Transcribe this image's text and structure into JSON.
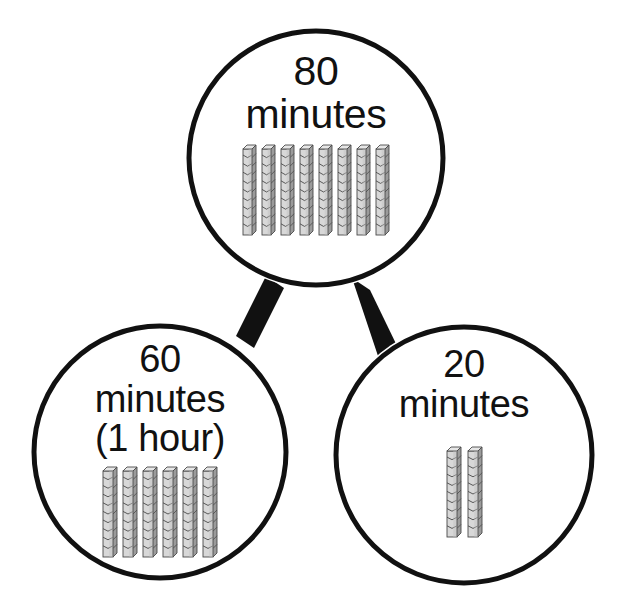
{
  "diagram": {
    "type": "number-bond",
    "background_color": "#ffffff",
    "outline_color": "#111111",
    "connector_color": "#111111"
  },
  "nodes": [
    {
      "id": "whole",
      "role": "whole",
      "label": "80\nminutes",
      "value": 80,
      "unit": "minutes",
      "rod_count": 8,
      "cubes_per_rod": 10,
      "center_x": 316,
      "center_y": 158,
      "radius": 131
    },
    {
      "id": "part-left",
      "role": "part",
      "label": "60\nminutes\n(1 hour)",
      "value": 60,
      "unit": "minutes",
      "equivalent": "1 hour",
      "rod_count": 6,
      "cubes_per_rod": 10,
      "center_x": 160,
      "center_y": 452,
      "radius": 130
    },
    {
      "id": "part-right",
      "role": "part",
      "label": "20\nminutes",
      "value": 20,
      "unit": "minutes",
      "rod_count": 2,
      "cubes_per_rod": 10,
      "center_x": 464,
      "center_y": 455,
      "radius": 132
    }
  ],
  "connectors": [
    {
      "id": "whole-to-left",
      "from": "whole",
      "to": "part-left"
    },
    {
      "id": "whole-to-right",
      "from": "whole",
      "to": "part-right"
    }
  ],
  "manipulative": {
    "name": "base-ten-rod",
    "fill_light": "#d8d8d8",
    "fill_mid": "#c2c2c2",
    "fill_dark": "#9b9b9b",
    "edge_color": "#4a4a4a"
  }
}
